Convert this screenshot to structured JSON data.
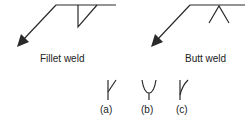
{
  "diagrams": [
    {
      "label": "Fillet weld",
      "symbol": "fillet-weld-triangle"
    },
    {
      "label": "Butt weld",
      "symbol": "butt-weld-v"
    }
  ],
  "variants": [
    {
      "label": "(a)",
      "symbol": "bevel-weld"
    },
    {
      "label": "(b)",
      "symbol": "u-weld"
    },
    {
      "label": "(c)",
      "symbol": "j-weld"
    }
  ],
  "colors": {
    "line": "#2a2a2a",
    "text": "#222222"
  }
}
